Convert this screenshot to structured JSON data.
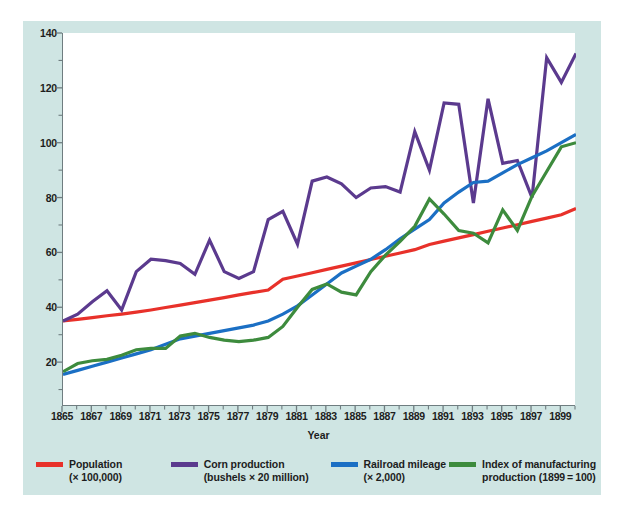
{
  "figure": {
    "background_panel_color": "#cfe5e3",
    "plot_background_color": "#ffffff",
    "axis_color": "#6f7d80"
  },
  "axis": {
    "xlabel": "Year",
    "ytick_labels": [
      "140",
      "120",
      "100",
      "80",
      "60",
      "40",
      "20"
    ],
    "ytick_values": [
      140,
      120,
      100,
      80,
      60,
      40,
      20
    ],
    "xtick_labels": [
      "1865",
      "1867",
      "1869",
      "1871",
      "1873",
      "1875",
      "1877",
      "1879",
      "1881",
      "1883",
      "1885",
      "1887",
      "1889",
      "1891",
      "1893",
      "1895",
      "1897",
      "1899"
    ],
    "xtick_values": [
      1865,
      1867,
      1869,
      1871,
      1873,
      1875,
      1877,
      1879,
      1881,
      1883,
      1885,
      1887,
      1889,
      1891,
      1893,
      1895,
      1897,
      1899
    ]
  },
  "legend": {
    "items": [
      {
        "key": "population",
        "line1": "Population",
        "line2": "(× 100,000)",
        "color": "#e8312a"
      },
      {
        "key": "corn",
        "line1": "Corn production",
        "line2": "(bushels × 20 million)",
        "color": "#5b3a8e"
      },
      {
        "key": "railroad",
        "line1": "Railroad mileage",
        "line2": "(× 2,000)",
        "color": "#1b6fc4"
      },
      {
        "key": "manufacturing",
        "line1": "Index of manufacturing",
        "line2": "production (1899 = 100)",
        "color": "#3d8b3d"
      }
    ]
  },
  "chart_data": {
    "type": "line",
    "title": "",
    "xlabel": "Year",
    "ylabel": "",
    "xlim": [
      1865,
      1900
    ],
    "ylim": [
      4,
      140
    ],
    "grid": false,
    "legend_position": "bottom",
    "x": [
      1865,
      1866,
      1867,
      1868,
      1869,
      1870,
      1871,
      1872,
      1873,
      1874,
      1875,
      1876,
      1877,
      1878,
      1879,
      1880,
      1881,
      1882,
      1883,
      1884,
      1885,
      1886,
      1887,
      1888,
      1889,
      1890,
      1891,
      1892,
      1893,
      1894,
      1895,
      1896,
      1897,
      1898,
      1899,
      1900
    ],
    "series": [
      {
        "name": "Population (× 100,000)",
        "color": "#e8312a",
        "values": [
          35.0,
          35.6,
          36.2,
          36.9,
          37.5,
          38.2,
          39.0,
          39.9,
          40.8,
          41.7,
          42.6,
          43.5,
          44.5,
          45.4,
          46.3,
          50.2,
          51.4,
          52.6,
          53.8,
          55.0,
          56.2,
          57.4,
          58.6,
          59.8,
          61.0,
          62.9,
          64.1,
          65.3,
          66.5,
          67.7,
          68.9,
          70.1,
          71.3,
          72.5,
          73.7,
          76.0
        ]
      },
      {
        "name": "Corn production (bushels × 20 million)",
        "color": "#5b3a8e",
        "values": [
          35.0,
          37.5,
          42.0,
          46.0,
          39.0,
          53.0,
          57.5,
          57.0,
          56.0,
          52.0,
          64.5,
          53.0,
          50.5,
          53.0,
          72.0,
          75.0,
          63.0,
          86.0,
          87.5,
          85.0,
          80.0,
          83.5,
          84.0,
          82.0,
          104.0,
          90.0,
          114.5,
          114.0,
          78.0,
          116.0,
          92.5,
          93.5,
          80.0,
          131.0,
          122.0,
          132.5
        ]
      },
      {
        "name": "Railroad mileage (× 2,000)",
        "color": "#1b6fc4",
        "values": [
          15.5,
          17.0,
          18.5,
          20.0,
          21.5,
          23.0,
          24.5,
          26.5,
          28.5,
          29.5,
          30.5,
          31.5,
          32.5,
          33.5,
          35.0,
          37.5,
          40.5,
          44.5,
          48.5,
          52.5,
          55.0,
          57.5,
          61.0,
          65.0,
          68.5,
          72.0,
          78.0,
          82.0,
          85.5,
          86.0,
          89.0,
          92.0,
          94.5,
          97.0,
          100.0,
          103.0
        ]
      },
      {
        "name": "Index of manufacturing production (1899 = 100)",
        "color": "#3d8b3d",
        "values": [
          16.5,
          19.5,
          20.5,
          21.0,
          22.5,
          24.5,
          25.0,
          25.0,
          29.5,
          30.5,
          29.0,
          28.0,
          27.5,
          28.0,
          29.0,
          33.0,
          40.0,
          46.5,
          48.5,
          45.5,
          44.5,
          53.0,
          59.0,
          64.0,
          69.5,
          79.5,
          74.0,
          68.0,
          67.0,
          63.5,
          75.5,
          68.0,
          80.5,
          89.5,
          98.5,
          100.0
        ]
      }
    ]
  }
}
